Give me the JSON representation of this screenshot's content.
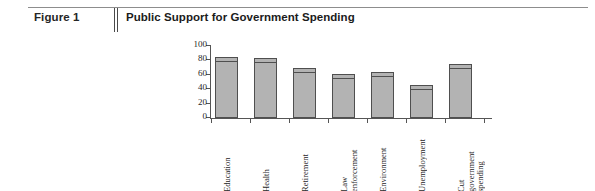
{
  "figure": {
    "number": "Figure 1",
    "title": "Public Support for Government Spending"
  },
  "chart_data": {
    "type": "bar",
    "title": "Public Support for Government Spending",
    "xlabel": "",
    "ylabel": "",
    "ylim": [
      0,
      100
    ],
    "yticks": [
      0,
      20,
      40,
      60,
      80,
      100
    ],
    "grid": false,
    "legend": "none",
    "categories": [
      "Education",
      "Health",
      "Retirement",
      "Law\nenforcement",
      "Environment",
      "Unemployment",
      "Cut\ngovernment\nspending"
    ],
    "values": [
      85,
      84,
      70,
      61,
      64,
      46,
      75
    ],
    "bar_fill": "#b3b3b3",
    "bar_border": "#4f4f4f"
  }
}
